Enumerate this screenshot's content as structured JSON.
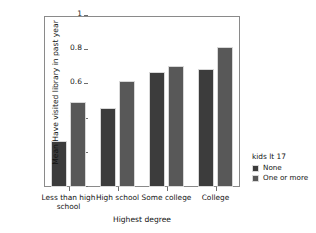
{
  "chart_data": {
    "type": "bar",
    "title": "",
    "subtitle": "",
    "xlabel": "Highest degree",
    "ylabel": "Mean Have visited library in past year",
    "categories": [
      "Less than high school",
      "High school",
      "Some college",
      "College"
    ],
    "series": [
      {
        "name": "None",
        "color": "#3c3c3c",
        "values": [
          0.27,
          0.46,
          0.67,
          0.69
        ]
      },
      {
        "name": "One or more",
        "color": "#585858",
        "values": [
          0.5,
          0.62,
          0.71,
          0.82
        ]
      }
    ],
    "ylim": [
      0,
      1
    ],
    "yticks": [
      0,
      0.2,
      0.4,
      0.6,
      0.8,
      1
    ],
    "ytick_labels": [
      "0",
      "0.2",
      "0.4",
      "0.6",
      "0.8",
      "1"
    ],
    "grid": false,
    "legend": {
      "title": "kids lt 17",
      "position": "right",
      "entries": [
        "None",
        "One or more"
      ]
    }
  }
}
